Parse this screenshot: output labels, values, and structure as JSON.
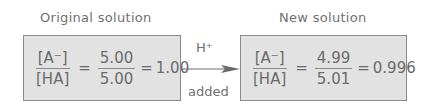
{
  "original": {
    "title": "Original solution",
    "lhs_num": "[A⁻]",
    "lhs_den": "[HA]",
    "equals1": "=",
    "rhs_num": "5.00",
    "rhs_den": "5.00",
    "equals2": "=",
    "result": "1.00"
  },
  "arrow": {
    "top_label": "H⁺",
    "bottom_label": "added"
  },
  "new": {
    "title": "New solution",
    "lhs_num": "[A⁻]",
    "lhs_den": "[HA]",
    "equals1": "=",
    "rhs_num": "4.99",
    "rhs_den": "5.01",
    "equals2": "=",
    "result": "0.996"
  },
  "colors": {
    "box_fill": "#e2e2e2",
    "box_border": "#8a8a8a",
    "text": "#6a6a6a",
    "arrow": "#6a6a6a"
  }
}
